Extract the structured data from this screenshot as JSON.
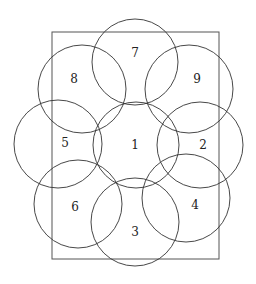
{
  "diagram": {
    "type": "overlapping-circles-in-rectangle",
    "stroke_color": "#333333",
    "rect_color": "#555555",
    "rectangle": {
      "x": 52,
      "y": 32,
      "width": 167,
      "height": 227
    },
    "circles": [
      {
        "label": "7",
        "cx": 135,
        "cy": 62,
        "r": 43,
        "lx": 135,
        "ly": 57
      },
      {
        "label": "8",
        "cx": 82,
        "cy": 89,
        "r": 44,
        "lx": 74,
        "ly": 83
      },
      {
        "label": "9",
        "cx": 189,
        "cy": 89,
        "r": 44,
        "lx": 197,
        "ly": 83
      },
      {
        "label": "5",
        "cx": 58,
        "cy": 144,
        "r": 44,
        "lx": 65,
        "ly": 147
      },
      {
        "label": "1",
        "cx": 136,
        "cy": 145,
        "r": 43,
        "lx": 135,
        "ly": 149
      },
      {
        "label": "2",
        "cx": 200,
        "cy": 145,
        "r": 43,
        "lx": 203,
        "ly": 149
      },
      {
        "label": "6",
        "cx": 78,
        "cy": 204,
        "r": 44,
        "lx": 75,
        "ly": 211
      },
      {
        "label": "3",
        "cx": 135,
        "cy": 222,
        "r": 44,
        "lx": 135,
        "ly": 236
      },
      {
        "label": "4",
        "cx": 186,
        "cy": 198,
        "r": 44,
        "lx": 195,
        "ly": 209
      }
    ]
  }
}
